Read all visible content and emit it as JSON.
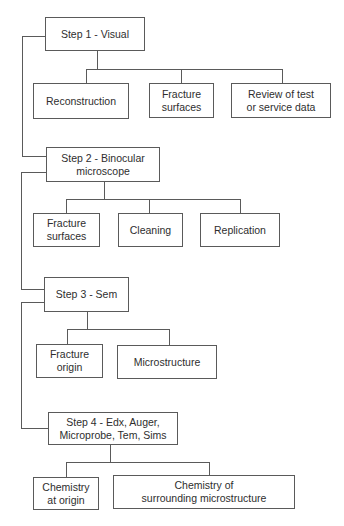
{
  "diagram": {
    "type": "flowchart",
    "steps": [
      {
        "label": "Step 1 - Visual",
        "children": [
          {
            "label": "Reconstruction"
          },
          {
            "label": "Fracture\nsurfaces"
          },
          {
            "label": "Review of test\nor service data"
          }
        ]
      },
      {
        "label": "Step 2 - Binocular\nmicroscope",
        "children": [
          {
            "label": "Fracture\nsurfaces"
          },
          {
            "label": "Cleaning"
          },
          {
            "label": "Replication"
          }
        ]
      },
      {
        "label": "Step 3 - Sem",
        "children": [
          {
            "label": "Fracture\norigin"
          },
          {
            "label": "Microstructure"
          }
        ]
      },
      {
        "label": "Step 4 - Edx, Auger,\nMicroprobe, Tem, Sims",
        "children": [
          {
            "label": "Chemistry\nat origin"
          },
          {
            "label": "Chemistry of\nsurrounding microstructure"
          }
        ]
      }
    ],
    "colors": {
      "line": "#5a5a5a",
      "text": "#2e2e2e",
      "background": "#ffffff"
    }
  }
}
